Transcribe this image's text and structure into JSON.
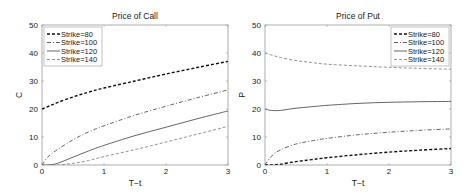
{
  "chart_data": [
    {
      "type": "line",
      "title": "Price of Call",
      "xlabel": "T−t",
      "ylabel": "C",
      "xlim": [
        0,
        3
      ],
      "ylim": [
        0,
        50
      ],
      "xticks": [
        0,
        1,
        2,
        3
      ],
      "yticks": [
        0,
        10,
        20,
        30,
        40,
        50
      ],
      "grid": false,
      "legend_position": "upper-left",
      "x": [
        0,
        0.1,
        0.25,
        0.5,
        0.75,
        1,
        1.5,
        2,
        2.5,
        3
      ],
      "series": [
        {
          "name": "Strike=80",
          "style": "dashed-black",
          "values": [
            20,
            20.9,
            22.3,
            24.3,
            26.0,
            27.5,
            30.0,
            32.5,
            34.8,
            37.0
          ]
        },
        {
          "name": "Strike=100",
          "style": "dashdot-gray",
          "values": [
            0,
            3.0,
            5.5,
            9.0,
            11.8,
            14.0,
            17.8,
            21.0,
            24.0,
            26.8
          ]
        },
        {
          "name": "Strike=120",
          "style": "solid-gray",
          "values": [
            0,
            0,
            0.6,
            2.8,
            5.0,
            7.0,
            10.5,
            13.5,
            16.5,
            19.3
          ]
        },
        {
          "name": "Strike=140",
          "style": "dashed-lightgray",
          "values": [
            0,
            0,
            0,
            0.6,
            1.6,
            3.0,
            5.5,
            8.2,
            11.0,
            13.8
          ]
        }
      ]
    },
    {
      "type": "line",
      "title": "Price of Put",
      "xlabel": "T−t",
      "ylabel": "P",
      "xlim": [
        0,
        3
      ],
      "ylim": [
        0,
        50
      ],
      "xticks": [
        0,
        1,
        2,
        3
      ],
      "yticks": [
        0,
        10,
        20,
        30,
        40,
        50
      ],
      "grid": false,
      "legend_position": "upper-right",
      "x": [
        0,
        0.1,
        0.25,
        0.5,
        0.75,
        1,
        1.5,
        2,
        2.5,
        3
      ],
      "series": [
        {
          "name": "Strike=80",
          "style": "dashed-black",
          "values": [
            0,
            0,
            0.3,
            1.2,
            1.9,
            2.6,
            3.7,
            4.6,
            5.3,
            5.9
          ]
        },
        {
          "name": "Strike=100",
          "style": "dashdot-gray",
          "values": [
            0,
            3.0,
            5.4,
            7.5,
            8.6,
            9.5,
            10.8,
            11.7,
            12.4,
            12.9
          ]
        },
        {
          "name": "Strike=120",
          "style": "solid-gray",
          "values": [
            20,
            19.5,
            19.5,
            20.3,
            20.8,
            21.3,
            22.0,
            22.4,
            22.6,
            22.7
          ]
        },
        {
          "name": "Strike=140",
          "style": "dashed-lightgray",
          "values": [
            40,
            39.3,
            38.4,
            37.3,
            36.6,
            36.0,
            35.4,
            34.9,
            34.5,
            34.2
          ]
        }
      ]
    }
  ],
  "styles": {
    "dashed-black": {
      "color": "#111111",
      "dash": "3,2",
      "width": 1.4
    },
    "dashdot-gray": {
      "color": "#555555",
      "dash": "4,2,1,2",
      "width": 0.9
    },
    "solid-gray": {
      "color": "#555555",
      "dash": "",
      "width": 0.9
    },
    "dashed-lightgray": {
      "color": "#888888",
      "dash": "3,2",
      "width": 0.9
    }
  }
}
